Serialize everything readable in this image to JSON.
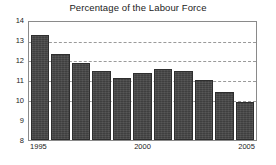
{
  "chart_data": {
    "type": "bar",
    "title": "Percentage of the Labour Force",
    "xlabel": "",
    "ylabel": "",
    "categories": [
      "1995",
      "1996",
      "1997",
      "1998",
      "1999",
      "2000",
      "2001",
      "2002",
      "2003",
      "2004",
      "2005"
    ],
    "values": [
      13.35,
      12.35,
      11.9,
      11.5,
      11.15,
      11.4,
      11.6,
      11.5,
      11.05,
      10.45,
      9.95
    ],
    "ylim": [
      8,
      14
    ],
    "yticks": [
      8,
      9,
      10,
      11,
      12,
      13,
      14
    ],
    "ytick_labels": [
      "8",
      "9",
      "10",
      "11",
      "12",
      "13",
      "14"
    ],
    "xtick_labels": [
      "1995",
      "2000",
      "2005"
    ],
    "xtick_categories": [
      "1995",
      "2000",
      "2005"
    ],
    "gridlines": [
      10,
      11,
      12,
      13
    ],
    "grid": true,
    "legend": "none",
    "colors": {
      "bar_fill": "#474747",
      "bar_edge": "#2e2e2e",
      "grid": "#9a9a9a",
      "frame": "#8a8a8a",
      "background": "#ffffff",
      "text": "#222222"
    }
  }
}
